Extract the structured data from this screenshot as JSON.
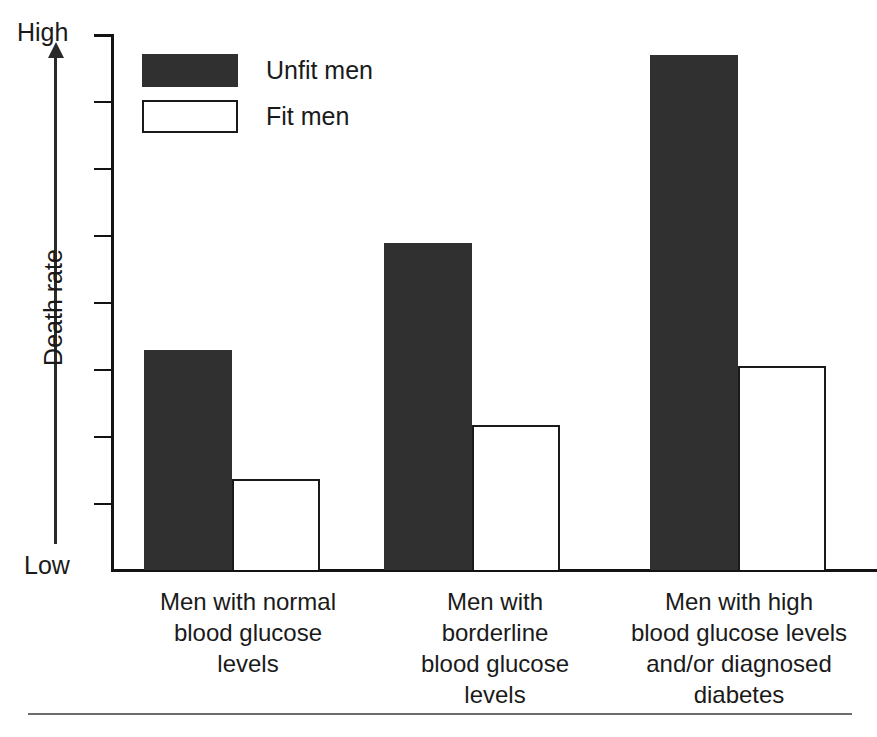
{
  "chart_data": {
    "type": "bar",
    "title": "",
    "subtitle": "",
    "xlabel": "",
    "ylabel": "Death rate",
    "axis_max_label": "High",
    "axis_min_label": "Low",
    "ylim": [
      0,
      1
    ],
    "y_axis_qualitative": true,
    "y_tick_count": 7,
    "grid": false,
    "legend_position": "top-left",
    "categories": [
      "Men with normal blood glucose levels",
      "Men with borderline blood glucose levels",
      "Men with high blood glucose levels and/or diagnosed diabetes"
    ],
    "category_label_lines": [
      [
        "Men with normal",
        "blood glucose",
        "levels"
      ],
      [
        "Men with",
        "borderline",
        "blood glucose",
        "levels"
      ],
      [
        "Men with high",
        "blood glucose levels",
        "and/or diagnosed",
        "diabetes"
      ]
    ],
    "series": [
      {
        "name": "Unfit men",
        "swatch": "filled",
        "color": "#303030",
        "values": [
          0.41,
          0.61,
          0.96
        ]
      },
      {
        "name": "Fit men",
        "swatch": "open",
        "color": "#ffffff",
        "values": [
          0.17,
          0.27,
          0.38
        ]
      }
    ]
  },
  "legend": {
    "items": [
      {
        "label": "Unfit men",
        "swatch": "filled"
      },
      {
        "label": "Fit men",
        "swatch": "open"
      }
    ]
  },
  "axis": {
    "y_title": "Death rate",
    "high_label": "High",
    "low_label": "Low"
  },
  "colors": {
    "bar_unfit": "#303030",
    "bar_fit": "#ffffff",
    "outline": "#1a1a1a",
    "axis": "#131313",
    "background": "#ffffff",
    "footer_rule": "#6d6d6d"
  }
}
